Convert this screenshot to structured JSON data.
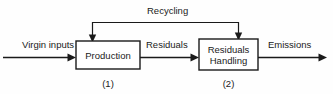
{
  "diagram": {
    "background_color": "#fefefe",
    "line_color": "#1a1a1a",
    "nodes": [
      {
        "id": "production",
        "label": "Production",
        "index_label": "(1)",
        "x": 76,
        "y": 41,
        "width": 64,
        "height": 28
      },
      {
        "id": "residuals-handling",
        "label_line1": "Residuals",
        "label_line2": "Handling",
        "index_label": "(2)",
        "x": 199,
        "y": 39,
        "width": 59,
        "height": 31
      }
    ],
    "edges": [
      {
        "id": "virgin-inputs",
        "label": "Virgin inputs",
        "from": "external",
        "to": "production"
      },
      {
        "id": "residuals",
        "label": "Residuals",
        "from": "production",
        "to": "residuals-handling"
      },
      {
        "id": "emissions",
        "label": "Emissions",
        "from": "residuals-handling",
        "to": "external"
      },
      {
        "id": "recycling",
        "label": "Recycling",
        "from": "residuals-handling",
        "to": "production"
      }
    ]
  }
}
